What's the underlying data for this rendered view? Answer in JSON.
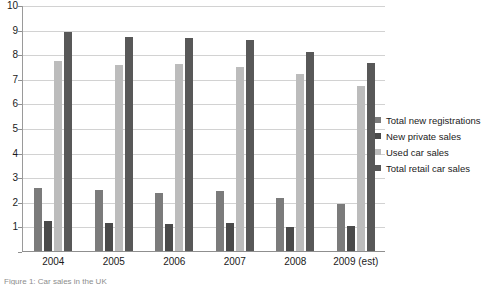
{
  "chart_data": {
    "type": "bar",
    "title": "",
    "subtitle": "",
    "xlabel": "",
    "ylabel": "",
    "ylim": [
      0,
      10
    ],
    "ytick_step": 1,
    "grid": true,
    "legend_position": "right",
    "categories": [
      "2004",
      "2005",
      "2006",
      "2007",
      "2008",
      "2009 (est)"
    ],
    "ytick_labels": [
      "10",
      "9",
      "8",
      "7",
      "6",
      "5",
      "4",
      "3",
      "2",
      "1"
    ],
    "series": [
      {
        "name": "Total new registrations",
        "color": "#7b7b7b",
        "values": [
          2.57,
          2.46,
          2.35,
          2.43,
          2.16,
          1.9
        ]
      },
      {
        "name": "New private sales",
        "color": "#4a4a4a",
        "values": [
          1.2,
          1.13,
          1.08,
          1.12,
          0.97,
          1.0
        ]
      },
      {
        "name": "Used car sales",
        "color": "#bcbcbc",
        "values": [
          7.72,
          7.58,
          7.6,
          7.48,
          7.18,
          6.72
        ]
      },
      {
        "name": "Total retail car sales",
        "color": "#585858",
        "values": [
          8.92,
          8.68,
          8.65,
          8.58,
          8.08,
          7.64
        ]
      }
    ]
  },
  "caption": {
    "text": "Figure 1: Car sales in the UK"
  },
  "colors": {
    "gridline": "#d2d2d2",
    "axis": "#8f8f8f",
    "text": "#1a1a1a",
    "background": "#ffffff"
  }
}
